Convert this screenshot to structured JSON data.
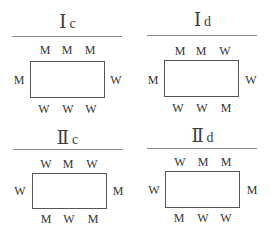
{
  "panels": [
    {
      "id": "Ic",
      "roman": "Ⅰ",
      "sub": "c",
      "top": [
        "M",
        "M",
        "M"
      ],
      "left": "M",
      "right": "W",
      "bottom": [
        "W",
        "W",
        "W"
      ]
    },
    {
      "id": "Id",
      "roman": "Ⅰ",
      "sub": "d",
      "top": [
        "M",
        "M",
        "W"
      ],
      "left": "M",
      "right": "W",
      "bottom": [
        "W",
        "W",
        "M"
      ]
    },
    {
      "id": "IIc",
      "roman": "Ⅱ",
      "sub": "c",
      "top": [
        "W",
        "M",
        "W"
      ],
      "left": "W",
      "right": "M",
      "bottom": [
        "M",
        "W",
        "M"
      ]
    },
    {
      "id": "IId",
      "roman": "Ⅱ",
      "sub": "d",
      "top": [
        "W",
        "M",
        "M"
      ],
      "left": "W",
      "right": "M",
      "bottom": [
        "M",
        "W",
        "W"
      ]
    }
  ]
}
